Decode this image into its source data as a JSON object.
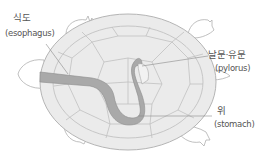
{
  "figure": {
    "labels": [
      {
        "id": "esophagus",
        "ko": "식도",
        "en": "(esophagus)"
      },
      {
        "id": "pylorus",
        "ko": "날문·유문",
        "en": "(pylorus)"
      },
      {
        "id": "stomach",
        "ko": "위",
        "en": "(stomach)"
      }
    ],
    "colors": {
      "shell_fill": "#ebebeb",
      "shell_stroke": "#b5b5b5",
      "organ_fill": "#a9a9a9",
      "organ_stroke": "#8c8c8c",
      "leader_line": "#8a8a8a",
      "text": "#555555"
    }
  }
}
